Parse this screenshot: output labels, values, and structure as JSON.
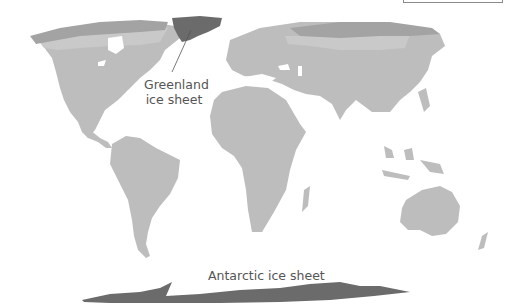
{
  "map": {
    "title": "",
    "colors": {
      "background": "#ffffff",
      "ice_sheet": "#6b6b6b",
      "tundra": "#a3a3a3",
      "boreal": "#c6c6c6",
      "land": "#bdbdbd",
      "label_text": "#555555",
      "leader_line": "#555555"
    },
    "labels": {
      "greenland_line1": "Greenland",
      "greenland_line2": "ice sheet",
      "antarctic": "Antarctic ice sheet"
    },
    "legend": {
      "visible": "partially cropped at top-right"
    }
  }
}
